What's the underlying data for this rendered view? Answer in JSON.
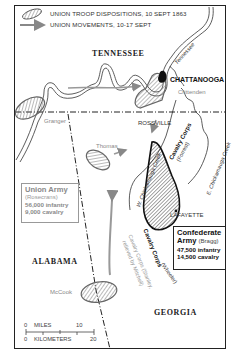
{
  "legend": {
    "dispositions_label": "UNION TROOP DISPOSITIONS, 10 SEPT 1863",
    "movements_label": "UNION MOVEMENTS, 10-17 SEPT",
    "dispositions_icon": "hatched-ellipse-icon",
    "movements_icon": "gray-arrow-icon"
  },
  "states": {
    "tennessee": "TENNESSEE",
    "alabama": "ALABAMA",
    "georgia": "GEORGIA"
  },
  "places": {
    "chattanooga": "CHATTANOOGA",
    "rossville": "ROSSVILLE",
    "lafayette": "LAFAYETTE",
    "crittenden": "Crittenden",
    "granger": "Granger",
    "thomas": "Thomas",
    "mccook": "McCook"
  },
  "rivers": {
    "tennessee": "Tennessee",
    "w_chickamauga": "W. Chickamauga Creek",
    "e_chickamauga": "E. Chickamauga Creek"
  },
  "units": {
    "cavalry_forrest": "Cavalry Corps",
    "cavalry_forrest_cmd": "(Forrest)",
    "cavalry_wheeler": "Cavalry Corps",
    "cavalry_wheeler_cmd": "(Wheeler)",
    "cavalry_stanley": "Cavalry Corps (Stanley,",
    "cavalry_stanley_2": "relieved by Mitchell)"
  },
  "union_army": {
    "title": "Union Army",
    "commander": "(Rosecrans)",
    "infantry": "56,000 infantry",
    "cavalry": "9,000 cavalry"
  },
  "confederate_army": {
    "title_line1": "Confederate",
    "title_line2": "Army",
    "commander": "(Bragg)",
    "infantry": "47,500 infantry",
    "cavalry": "14,500 cavalry"
  },
  "scale": {
    "miles_label": "MILES",
    "miles_start": "0",
    "miles_end": "10",
    "km_label": "KILOMETERS",
    "km_start": "0",
    "km_end": "20"
  },
  "colors": {
    "border": "#222222",
    "union_gray": "#8a8a8a",
    "confederate": "#111111",
    "hatch": "#555555"
  }
}
